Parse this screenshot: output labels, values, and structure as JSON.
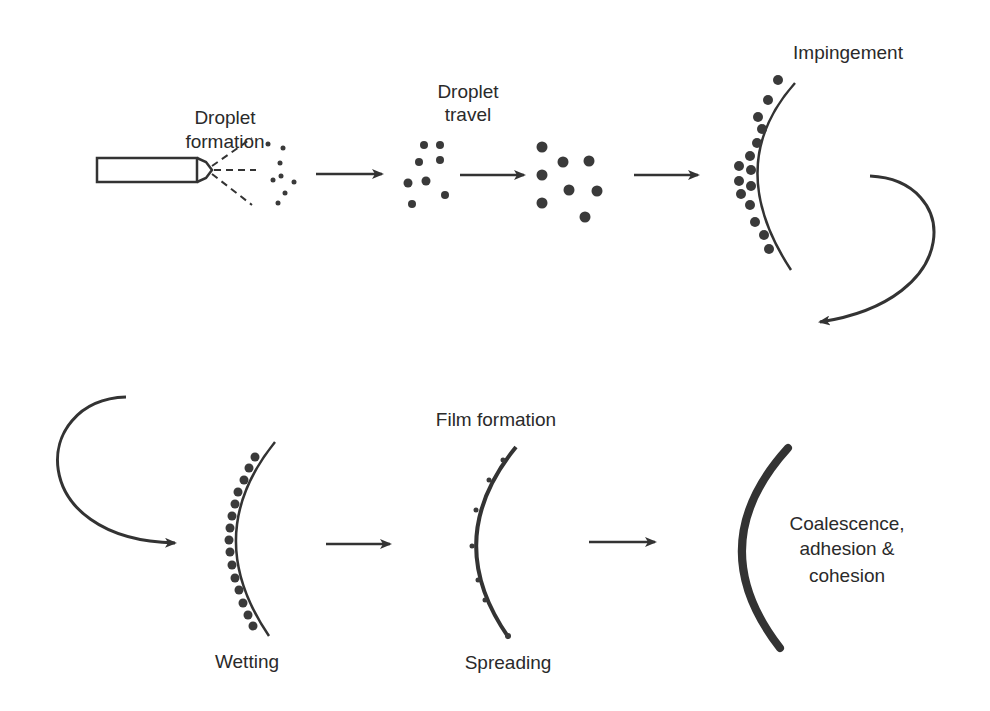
{
  "diagram": {
    "stages": [
      {
        "id": "droplet-formation",
        "label_lines": [
          "Droplet",
          "formation"
        ]
      },
      {
        "id": "droplet-travel",
        "label_lines": [
          "Droplet",
          "travel"
        ]
      },
      {
        "id": "impingement",
        "label_lines": [
          "Impingement"
        ]
      },
      {
        "id": "wetting",
        "label_lines": [
          "Wetting"
        ]
      },
      {
        "id": "spreading",
        "label_lines": [
          "Spreading"
        ]
      },
      {
        "id": "coalescence",
        "label_lines": [
          "Coalescence,",
          "adhesion &",
          "cohesion"
        ]
      }
    ],
    "group_label": "Film formation",
    "colors": {
      "ink": "#333333",
      "background": "#ffffff"
    }
  }
}
